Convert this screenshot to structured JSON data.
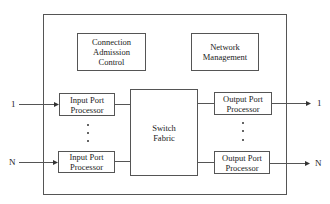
{
  "diagram": {
    "type": "block-diagram",
    "blocks": {
      "connection_admission_control": {
        "line1": "Connection",
        "line2": "Admission",
        "line3": "Control"
      },
      "network_management": {
        "line1": "Network",
        "line2": "Management"
      },
      "switch_fabric": {
        "line1": "Switch",
        "line2": "Fabric"
      },
      "input_port_1": {
        "line1": "Input Port",
        "line2": "Processor"
      },
      "input_port_n": {
        "line1": "Input Port",
        "line2": "Processor"
      },
      "output_port_1": {
        "line1": "Output Port",
        "line2": "Processor"
      },
      "output_port_n": {
        "line1": "Output Port",
        "line2": "Processor"
      }
    },
    "labels": {
      "input_1": "1",
      "input_n": "N",
      "output_1": "1",
      "output_n": "N"
    },
    "colors": {
      "line": "#555555",
      "background": "#ffffff"
    }
  }
}
